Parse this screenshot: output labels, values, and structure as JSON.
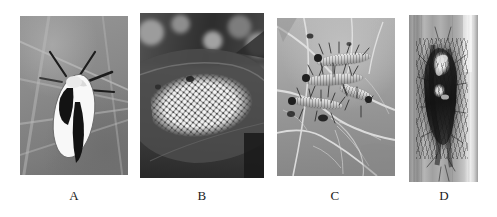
{
  "figure": {
    "type": "multi-panel-photographic-plate",
    "panel_count": 4,
    "color_mode": "grayscale",
    "background_color": "#ffffff",
    "width_px": 497,
    "height_px": 217,
    "panels": [
      {
        "label": "A",
        "name": "panel-a",
        "subject": "adult moth resting on leaf",
        "description": "Pale cream-white moth with dark longitudinal markings and dark antennae, resting on a broad grey-green leaf showing pale veins",
        "x": 20,
        "y": 16,
        "width": 108,
        "height": 159,
        "label_x": 70,
        "label_y": 190,
        "dominant_color": "#8a8a85",
        "accent_color": "#f4f4ec"
      },
      {
        "label": "B",
        "name": "panel-b",
        "subject": "egg mass on leaf underside",
        "description": "Dense cluster of several hundred pale white cylindrical eggs laid in tight rows on a dark leaf surface, blurred dark foliage behind",
        "x": 140,
        "y": 13,
        "width": 124,
        "height": 165,
        "label_x": 195,
        "label_y": 190,
        "dominant_color": "#44443f",
        "accent_color": "#f0f0e9"
      },
      {
        "label": "C",
        "name": "panel-c",
        "subject": "gregarious hairy larvae feeding on leaf",
        "description": "Several pale banded hairy caterpillars with dark heads and long setae feeding together on a pale leaf with prominent reticulate venation",
        "x": 277,
        "y": 18,
        "width": 118,
        "height": 158,
        "label_x": 328,
        "label_y": 190,
        "dominant_color": "#a6a69e",
        "accent_color": "#e2e2da"
      },
      {
        "label": "D",
        "name": "panel-d",
        "subject": "cocoon on woody stem",
        "description": "Dark elongated silken cocoon with matted larval hairs attached lengthwise to a pale vertical woody stem",
        "x": 409,
        "y": 15,
        "width": 69,
        "height": 167,
        "label_x": 437,
        "label_y": 190,
        "dominant_color": "#a8a8a0",
        "accent_color": "#1d1d1a"
      }
    ]
  },
  "labels": {
    "a": "A",
    "b": "B",
    "c": "C",
    "d": "D"
  }
}
